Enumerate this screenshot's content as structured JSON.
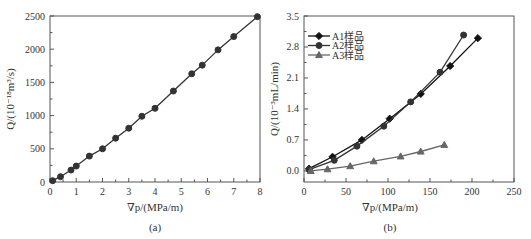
{
  "figure": {
    "panels": [
      {
        "id": "a",
        "caption": "(a)"
      },
      {
        "id": "b",
        "caption": "(b)"
      }
    ]
  },
  "chart_data": [
    {
      "type": "line",
      "panel": "(a)",
      "title": "",
      "xlabel": "∇p/(MPa/m)",
      "ylabel": "Q/(10⁻¹⁸m³/s)",
      "xlim": [
        0,
        8
      ],
      "ylim": [
        0,
        2500
      ],
      "xticks": [
        0,
        1,
        2,
        3,
        4,
        5,
        6,
        7,
        8
      ],
      "yticks": [
        0,
        500,
        1000,
        1500,
        2000,
        2500
      ],
      "grid": false,
      "legend": null,
      "series": [
        {
          "name": "",
          "marker": "circle",
          "color": "#333333",
          "x": [
            0.1,
            0.4,
            0.8,
            1.0,
            1.5,
            2.0,
            2.5,
            3.0,
            3.5,
            4.0,
            4.7,
            5.4,
            5.8,
            6.4,
            7.0,
            7.9
          ],
          "y": [
            20,
            80,
            180,
            240,
            390,
            500,
            660,
            810,
            990,
            1110,
            1370,
            1630,
            1760,
            1990,
            2190,
            2490
          ]
        }
      ]
    },
    {
      "type": "line",
      "panel": "(b)",
      "title": "",
      "xlabel": "∇p/(MPa/m)",
      "ylabel": "Q/(10⁻³mL/min)",
      "xlim": [
        0,
        250
      ],
      "ylim": [
        -0.25,
        3.5
      ],
      "xticks": [
        0,
        50,
        100,
        150,
        200,
        250
      ],
      "yticks": [
        0.0,
        0.7,
        1.4,
        2.1,
        2.8,
        3.5
      ],
      "ytick_labels": [
        "0.0",
        "0.7",
        "1.4",
        "2.1",
        "2.8",
        "3.5"
      ],
      "grid": false,
      "legend_position": "upper left",
      "series": [
        {
          "name": "A1样品",
          "marker": "diamond",
          "color": "#111111",
          "x": [
            6,
            34,
            69,
            102,
            139,
            174,
            207
          ],
          "y": [
            0.05,
            0.32,
            0.7,
            1.18,
            1.74,
            2.37,
            3.0
          ]
        },
        {
          "name": "A2样品",
          "marker": "circle",
          "color": "#333333",
          "x": [
            6,
            36,
            63,
            95,
            127,
            162,
            190
          ],
          "y": [
            0.03,
            0.24,
            0.56,
            1.01,
            1.56,
            2.23,
            3.07
          ]
        },
        {
          "name": "A3样品",
          "marker": "triangle",
          "color": "#666666",
          "x": [
            8,
            28,
            55,
            83,
            115,
            139,
            167
          ],
          "y": [
            0.0,
            0.04,
            0.11,
            0.22,
            0.33,
            0.44,
            0.59
          ]
        }
      ]
    }
  ]
}
